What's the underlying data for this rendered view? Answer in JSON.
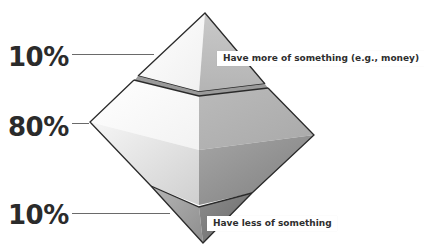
{
  "diagram": {
    "type": "inverted-distribution-diamond",
    "tiers": [
      {
        "id": "top",
        "percent_label": "10%",
        "callout": "Have more of something (e.g., money)"
      },
      {
        "id": "middle",
        "percent_label": "80%",
        "callout": ""
      },
      {
        "id": "bottom",
        "percent_label": "10%",
        "callout": "Have less of something"
      }
    ],
    "colors": {
      "outline": "#2a2a2a",
      "light_face": "#f4f4f4",
      "mid_face": "#bdbdbd",
      "dark_face": "#8a8a8a",
      "label_text": "#2b2b2b",
      "leader_line": "#6a6a6a"
    }
  }
}
